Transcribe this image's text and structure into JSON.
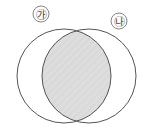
{
  "figure": {
    "background_color": "#ffffff",
    "width": 152,
    "height": 131
  },
  "labels": {
    "left": "㉮",
    "right": "㉯",
    "left_name": "circled-ga",
    "right_name": "circled-na"
  },
  "sets": [
    {
      "id": "left-circle",
      "label": "㉮",
      "center_x": 64,
      "center_y": 76,
      "radius": 47,
      "stroke_color": "#555555",
      "fill": "none"
    },
    {
      "id": "right-circle",
      "label": "㉯",
      "center_x": 89,
      "center_y": 76,
      "radius": 47,
      "stroke_color": "#555555",
      "fill": "none"
    }
  ],
  "intersection": {
    "id": "lens-region",
    "shaded": true,
    "fill_color": "#dcdcdc",
    "hatch_color": "#c9c9c9",
    "hatch_angle_deg": 45,
    "left_x": 52,
    "right_x": 113,
    "top_y": 30,
    "bottom_y": 122
  }
}
